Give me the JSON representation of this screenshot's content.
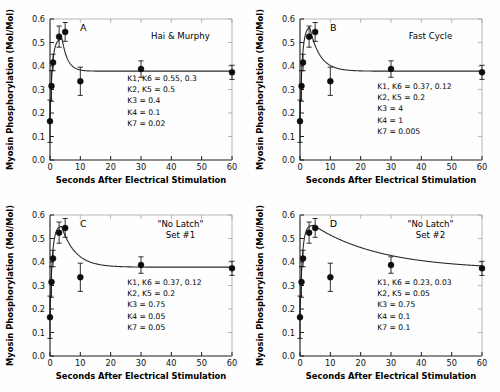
{
  "figure": {
    "background_color": "#ffffff",
    "marker_color": "#0d0d0d",
    "curve_color": "#2b2b2b",
    "axis_color": "#1a1a1a"
  },
  "chart_data": [
    {
      "type": "scatter",
      "panel": "A",
      "title": "Hai & Murphy",
      "xlabel": "Seconds After Electrical Stimulation",
      "ylabel": "Myosin Phosphorylation (Mol/Mol)",
      "xlim": [
        0,
        60
      ],
      "ylim": [
        0.0,
        0.6
      ],
      "xticks": [
        0,
        10,
        20,
        30,
        40,
        50,
        60
      ],
      "xticklabels": [
        "0",
        "10",
        "20",
        "30",
        "40",
        "50",
        "60"
      ],
      "yticks": [
        0.0,
        0.1,
        0.2,
        0.3,
        0.4,
        0.5,
        0.6
      ],
      "yticklabels": [
        "0.0",
        "0.1",
        "0.2",
        "0.3",
        "0.4",
        "0.5",
        "0.6"
      ],
      "grid": false,
      "legend": "none",
      "x": [
        0,
        0.5,
        1,
        3,
        5,
        10,
        30,
        60
      ],
      "values": [
        0.165,
        0.315,
        0.415,
        0.525,
        0.545,
        0.335,
        0.387,
        0.373
      ],
      "yerr": [
        0.09,
        0.065,
        0.035,
        0.045,
        0.04,
        0.06,
        0.035,
        0.03
      ],
      "curve": {
        "peak_time": 4.0,
        "peak_value": 0.515,
        "plateau_value": 0.378,
        "decay_rate": 0.55
      },
      "annotations": [
        "K1, K6 = 0.55, 0.3",
        "K2, K5 = 0.5",
        "K3 = 0.4",
        "K4 = 0.1",
        "K7 = 0.02"
      ]
    },
    {
      "type": "scatter",
      "panel": "B",
      "title": "Fast Cycle",
      "xlabel": "Seconds After Electrical Stimulation",
      "ylabel": "Myosin Phosphorylation (Mol/Mol)",
      "xlim": [
        0,
        60
      ],
      "ylim": [
        0.0,
        0.6
      ],
      "xticks": [
        0,
        10,
        20,
        30,
        40,
        50,
        60
      ],
      "xticklabels": [
        "0",
        "10",
        "20",
        "30",
        "40",
        "50",
        "60"
      ],
      "yticks": [
        0.0,
        0.1,
        0.2,
        0.3,
        0.4,
        0.5,
        0.6
      ],
      "yticklabels": [
        "0.0",
        "0.1",
        "0.2",
        "0.3",
        "0.4",
        "0.5",
        "0.6"
      ],
      "grid": false,
      "legend": "none",
      "x": [
        0,
        0.5,
        1,
        3,
        5,
        10,
        30,
        60
      ],
      "values": [
        0.165,
        0.315,
        0.415,
        0.525,
        0.545,
        0.335,
        0.387,
        0.373
      ],
      "yerr": [
        0.09,
        0.065,
        0.035,
        0.045,
        0.04,
        0.06,
        0.035,
        0.03
      ],
      "curve": {
        "peak_time": 3.2,
        "peak_value": 0.565,
        "plateau_value": 0.378,
        "decay_rate": 0.3
      },
      "annotations": [
        "K1, K6 = 0.37, 0.12",
        "K2, K5 = 0.2",
        "K3 = 4",
        "K4 = 1",
        "K7 = 0.005"
      ]
    },
    {
      "type": "scatter",
      "panel": "C",
      "title": "\"No Latch\"",
      "subtitle": "Set #1",
      "xlabel": "Seconds After Electrical Stimulation",
      "ylabel": "Myosin Phosphorylation (Mol/Mol)",
      "xlim": [
        0,
        60
      ],
      "ylim": [
        0.0,
        0.6
      ],
      "xticks": [
        0,
        10,
        20,
        30,
        40,
        50,
        60
      ],
      "xticklabels": [
        "0",
        "10",
        "20",
        "30",
        "40",
        "50",
        "60"
      ],
      "yticks": [
        0.0,
        0.1,
        0.2,
        0.3,
        0.4,
        0.5,
        0.6
      ],
      "yticklabels": [
        "0.0",
        "0.1",
        "0.2",
        "0.3",
        "0.4",
        "0.5",
        "0.6"
      ],
      "grid": false,
      "legend": "none",
      "x": [
        0,
        0.5,
        1,
        3,
        5,
        10,
        30,
        60
      ],
      "values": [
        0.165,
        0.315,
        0.415,
        0.525,
        0.545,
        0.335,
        0.387,
        0.373
      ],
      "yerr": [
        0.09,
        0.065,
        0.035,
        0.045,
        0.04,
        0.06,
        0.035,
        0.03
      ],
      "curve": {
        "peak_time": 3.8,
        "peak_value": 0.552,
        "plateau_value": 0.378,
        "decay_rate": 0.22
      },
      "annotations": [
        "K1, K6 = 0.37, 0.12",
        "K2, K5 = 0.2",
        "K3 = 0.75",
        "K4 = 0.05",
        "K7 = 0.05"
      ]
    },
    {
      "type": "scatter",
      "panel": "D",
      "title": "\"No Latch\"",
      "subtitle": "Set #2",
      "xlabel": "Seconds After Electrical Stimulation",
      "ylabel": "Myosin Phosphorylation (Mol/Mol)",
      "xlim": [
        0,
        60
      ],
      "ylim": [
        0.0,
        0.6
      ],
      "xticks": [
        0,
        10,
        20,
        30,
        40,
        50,
        60
      ],
      "xticklabels": [
        "0",
        "10",
        "20",
        "30",
        "40",
        "50",
        "60"
      ],
      "yticks": [
        0.0,
        0.1,
        0.2,
        0.3,
        0.4,
        0.5,
        0.6
      ],
      "yticklabels": [
        "0.0",
        "0.1",
        "0.2",
        "0.3",
        "0.4",
        "0.5",
        "0.6"
      ],
      "grid": false,
      "legend": "none",
      "x": [
        0,
        0.5,
        1,
        3,
        5,
        10,
        30,
        60
      ],
      "values": [
        0.165,
        0.315,
        0.415,
        0.525,
        0.545,
        0.335,
        0.387,
        0.373
      ],
      "yerr": [
        0.09,
        0.065,
        0.035,
        0.045,
        0.04,
        0.06,
        0.035,
        0.03
      ],
      "curve": {
        "peak_time": 4.5,
        "peak_value": 0.556,
        "plateau_value": 0.368,
        "decay_rate": 0.045
      },
      "annotations": [
        "K1, K6 = 0.23, 0.03",
        "K2, K5 = 0.05",
        "K3 = 0.75",
        "K4 = 0.1",
        "K7 = 0.1"
      ]
    }
  ]
}
